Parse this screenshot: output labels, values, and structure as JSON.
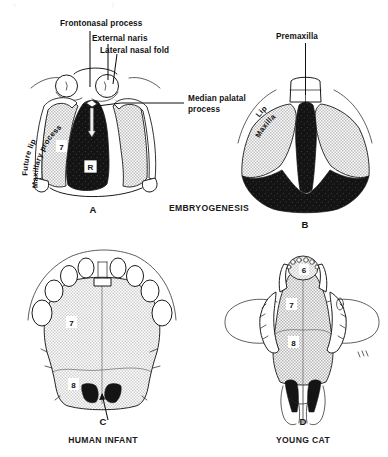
{
  "figure": {
    "title_visible": false,
    "background_color": "#ffffff",
    "ink_color": "#111111",
    "stipple_color": "#c9c9c9",
    "dark_region_color": "#141414",
    "panels": [
      {
        "id": "A",
        "letter": "A",
        "section_caption": "EMBRYOGENESIS",
        "labels": [
          {
            "name": "frontonasal-process",
            "text": "Frontonasal process"
          },
          {
            "name": "external-naris",
            "text": "External naris"
          },
          {
            "name": "lateral-nasal-fold",
            "text": "Lateral nasal fold"
          },
          {
            "name": "median-palatal-process",
            "text": "Median palatal process"
          },
          {
            "name": "future-lip",
            "text": "Future lip"
          },
          {
            "name": "maxillary-process",
            "text": "Maxillary process"
          }
        ],
        "region_markers": [
          {
            "name": "region-7",
            "text": "7"
          },
          {
            "name": "region-R",
            "text": "R"
          }
        ]
      },
      {
        "id": "B",
        "letter": "B",
        "labels": [
          {
            "name": "premaxilla",
            "text": "Premaxilla"
          },
          {
            "name": "lip",
            "text": "Lip"
          },
          {
            "name": "maxilla",
            "text": "Maxilla"
          }
        ],
        "region_markers": []
      },
      {
        "id": "C",
        "letter": "C",
        "caption": "HUMAN INFANT",
        "labels": [],
        "region_markers": [
          {
            "name": "region-7",
            "text": "7"
          },
          {
            "name": "region-8",
            "text": "8"
          }
        ]
      },
      {
        "id": "D",
        "letter": "D",
        "caption": "YOUNG CAT",
        "labels": [],
        "region_markers": [
          {
            "name": "region-6",
            "text": "6"
          },
          {
            "name": "region-7",
            "text": "7"
          },
          {
            "name": "region-8",
            "text": "8"
          }
        ]
      }
    ],
    "section_labels": [
      {
        "name": "embryogenesis-label",
        "text": "EMBRYOGENESIS"
      }
    ],
    "bottom_captions": [
      {
        "name": "caption-human-infant",
        "text": "HUMAN INFANT"
      },
      {
        "name": "caption-young-cat",
        "text": "YOUNG CAT"
      }
    ]
  },
  "text": {
    "frontonasal_process": "Frontonasal process",
    "external_naris": "External naris",
    "lateral_nasal_fold": "Lateral nasal fold",
    "median_palatal_line1": "Median palatal",
    "median_palatal_line2": "process",
    "future_lip": "Future lip",
    "maxillary_process": "Maxillary process",
    "premaxilla": "Premaxilla",
    "lip": "Lip",
    "maxilla": "Maxilla",
    "embryogenesis": "EMBRYOGENESIS",
    "human_infant": "HUMAN INFANT",
    "young_cat": "YOUNG CAT",
    "letter_a": "A",
    "letter_b": "B",
    "letter_c": "C",
    "letter_d": "D",
    "num_6": "6",
    "num_7": "7",
    "num_8": "8",
    "marker_r": "R"
  }
}
